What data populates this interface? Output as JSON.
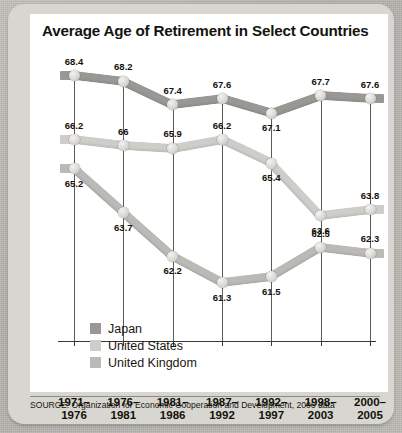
{
  "figure": {
    "title": "Average Age of Retirement in Select Countries",
    "source": "SOURCE: Organization for Economic Cooperation and Development, 2006 data"
  },
  "legend": {
    "items": [
      {
        "label": "Japan",
        "color": "#9a9894"
      },
      {
        "label": "United States",
        "color": "#cfcdc9"
      },
      {
        "label": "United Kingdom",
        "color": "#bcbab6"
      }
    ]
  },
  "axis": {
    "categories": [
      {
        "line1": "1971–",
        "line2": "1976"
      },
      {
        "line1": "1976–",
        "line2": "1981"
      },
      {
        "line1": "1981–",
        "line2": "1986"
      },
      {
        "line1": "1987–",
        "line2": "1992"
      },
      {
        "line1": "1992–",
        "line2": "1997"
      },
      {
        "line1": "1998–",
        "line2": "2003"
      },
      {
        "line1": "2000–",
        "line2": "2005"
      }
    ]
  },
  "chart_data": {
    "type": "line",
    "title": "Average Age of Retirement in Select Countries",
    "xlabel": "",
    "ylabel": "",
    "ylim": [
      60.5,
      69.0
    ],
    "grid": "vertical category lines",
    "legend_position": "inside-bottom-left",
    "categories": [
      "1971-1976",
      "1976-1981",
      "1981-1986",
      "1987-1992",
      "1992-1997",
      "1998-2003",
      "2000-2005"
    ],
    "series": [
      {
        "name": "Japan",
        "color": "#9a9894",
        "values": [
          68.4,
          68.2,
          67.4,
          67.6,
          67.1,
          67.7,
          67.6
        ],
        "labels": [
          "68.4",
          "68.2",
          "67.4",
          "67.6",
          "67.1",
          "67.7",
          "67.6"
        ]
      },
      {
        "name": "United States",
        "color": "#cfcdc9",
        "values": [
          66.2,
          66.0,
          65.9,
          66.2,
          65.4,
          63.6,
          63.8
        ],
        "labels": [
          "66.2",
          "66",
          "65.9",
          "66.2",
          "65.4",
          "63.6",
          "63.8"
        ]
      },
      {
        "name": "United Kingdom",
        "color": "#bcbab6",
        "values": [
          65.2,
          63.7,
          62.2,
          61.3,
          61.5,
          62.5,
          62.3
        ],
        "labels": [
          "65.2",
          "63.7",
          "62.2",
          "61.3",
          "61.5",
          "62.5",
          "62.3"
        ]
      }
    ],
    "annotation_source": "SOURCE: Organization for Economic Cooperation and Development, 2006 data"
  }
}
